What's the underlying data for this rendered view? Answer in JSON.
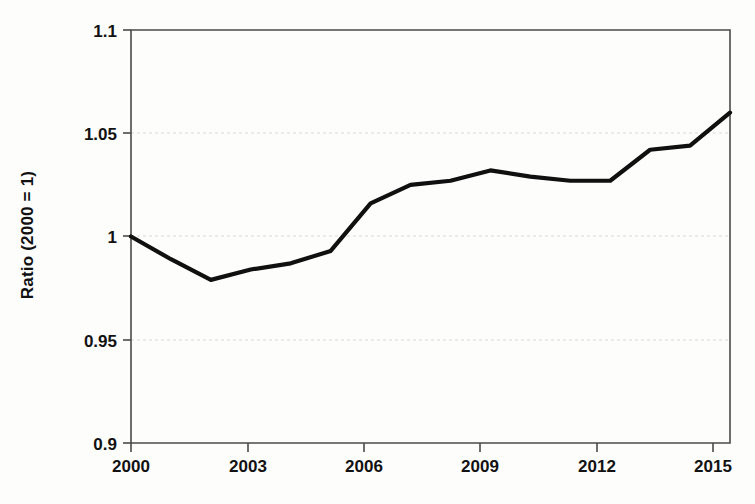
{
  "chart_data": {
    "type": "line",
    "title": "",
    "subtitle": "",
    "xlabel": "",
    "ylabel": "Ratio (2000 = 1)",
    "x": [
      2000,
      2001,
      2002,
      2003,
      2004,
      2005,
      2006,
      2007,
      2008,
      2009,
      2010,
      2011,
      2012,
      2013,
      2014,
      2015
    ],
    "values": [
      1.0,
      0.989,
      0.979,
      0.984,
      0.987,
      0.993,
      1.016,
      1.025,
      1.027,
      1.032,
      1.029,
      1.027,
      1.027,
      1.042,
      1.044,
      1.06
    ],
    "series": [
      {
        "name": "Ratio (2000 = 1)",
        "color": "#101010",
        "values": [
          1.0,
          0.989,
          0.979,
          0.984,
          0.987,
          0.993,
          1.016,
          1.025,
          1.027,
          1.032,
          1.029,
          1.027,
          1.027,
          1.042,
          1.044,
          1.06
        ]
      }
    ],
    "xlim": [
      2000,
      2015
    ],
    "ylim": [
      0.9,
      1.1
    ],
    "xticks": [
      2000,
      2003,
      2006,
      2009,
      2012,
      2015
    ],
    "xtick_labels": [
      "2000",
      "2003",
      "2006",
      "2009",
      "2012",
      "2015"
    ],
    "yticks": [
      0.9,
      0.95,
      1.0,
      1.05,
      1.1
    ],
    "ytick_labels": [
      "0.9",
      "0.95",
      "1",
      "1.05",
      "1.1"
    ],
    "gridlines": {
      "x": false,
      "y": true,
      "y_values": [
        0.95,
        1.0,
        1.05
      ],
      "style": "dotted",
      "color": "#d9d9d4"
    },
    "legend": {
      "visible": false,
      "position": "none"
    },
    "annotations": [],
    "background_color": "#fdfdfb",
    "axis_color": "#4a4a4a",
    "line_width": 4.2
  }
}
